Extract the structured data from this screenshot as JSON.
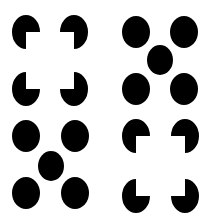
{
  "figure": {
    "fill_color": "#000000",
    "background_color": "#ffffff",
    "panels": [
      {
        "id": "top-left",
        "kind": "pacman-square",
        "inducers": [
          "notch-bottom-right",
          "notch-bottom-left",
          "notch-top-right",
          "notch-top-left"
        ]
      },
      {
        "id": "top-right",
        "kind": "quincunx-dots",
        "dot_count": 5
      },
      {
        "id": "bottom-left",
        "kind": "quincunx-dots",
        "dot_count": 5
      },
      {
        "id": "bottom-right",
        "kind": "pacman-square",
        "inducers": [
          "notch-bottom-right",
          "notch-bottom-left",
          "notch-top-right",
          "notch-top-left"
        ]
      }
    ]
  }
}
